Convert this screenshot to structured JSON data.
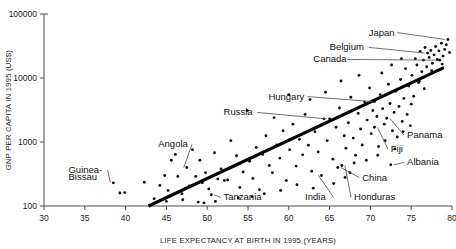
{
  "chart_data": {
    "type": "scatter",
    "title": "",
    "xlabel": "LIFE EXPECTANCY AT BIRTH IN 1995 (YEARS)",
    "ylabel": "GNP PER CAPITA IN 1995 (US$)",
    "xlim": [
      30,
      80
    ],
    "ylim": [
      100,
      100000
    ],
    "yscale": "log",
    "xscale": "linear",
    "grid": false,
    "legend": null,
    "xticks": [
      30,
      35,
      40,
      45,
      50,
      55,
      60,
      65,
      70,
      75,
      80
    ],
    "xtick_labels": [
      "30",
      "35",
      "40",
      "45",
      "50",
      "55",
      "60",
      "65",
      "70",
      "75",
      "80"
    ],
    "yticks": [
      100,
      1000,
      10000,
      100000
    ],
    "ytick_labels": [
      "100",
      "1000",
      "10000",
      "100000"
    ],
    "trendline": {
      "type": "linear-on-log",
      "x_start": 42.8,
      "y_start": 100,
      "x_end": 79.0,
      "y_end": 14500
    },
    "annotations": [
      {
        "label": "Japan",
        "text_x": 69.8,
        "text_y": 46000,
        "point_x": 79.5,
        "point_y": 40000,
        "anchor": "start"
      },
      {
        "label": "Belgium",
        "text_x": 65.0,
        "text_y": 27000,
        "point_x": 77.0,
        "point_y": 24500,
        "anchor": "start"
      },
      {
        "label": "Canada",
        "text_x": 63.0,
        "text_y": 17500,
        "point_x": 78.5,
        "point_y": 19000,
        "anchor": "start"
      },
      {
        "label": "Hungary",
        "text_x": 57.5,
        "text_y": 4600,
        "point_x": 70.5,
        "point_y": 4300,
        "anchor": "start"
      },
      {
        "label": "Russia",
        "text_x": 52.0,
        "text_y": 2600,
        "point_x": 65.0,
        "point_y": 2300,
        "anchor": "start"
      },
      {
        "label": "Angola",
        "text_x": 44.0,
        "text_y": 830,
        "point_x": 47.5,
        "point_y": 400,
        "anchor": "start"
      },
      {
        "label": "Guinea-",
        "text_x": 33.0,
        "text_y": 330,
        "point_x": 38.5,
        "point_y": 230,
        "anchor": "start"
      },
      {
        "label": "Bissau",
        "text_x": 33.0,
        "text_y": 255,
        "point_x": null,
        "point_y": null,
        "anchor": "start"
      },
      {
        "label": "Tanzania",
        "text_x": 52.0,
        "text_y": 122,
        "point_x": 50.5,
        "point_y": 150,
        "anchor": "start"
      },
      {
        "label": "India",
        "text_x": 62.0,
        "text_y": 122,
        "point_x": 64.0,
        "point_y": 300,
        "anchor": "start"
      },
      {
        "label": "Honduras",
        "text_x": 68.0,
        "text_y": 122,
        "point_x": 66.5,
        "point_y": 430,
        "anchor": "start"
      },
      {
        "label": "China",
        "text_x": 69.0,
        "text_y": 250,
        "point_x": 66.0,
        "point_y": 400,
        "anchor": "start"
      },
      {
        "label": "Albania",
        "text_x": 74.5,
        "text_y": 430,
        "point_x": 72.5,
        "point_y": 440,
        "anchor": "start"
      },
      {
        "label": "Fiji",
        "text_x": 72.5,
        "text_y": 700,
        "point_x": 70.5,
        "point_y": 1700,
        "anchor": "start"
      },
      {
        "label": "Panama",
        "text_x": 74.5,
        "text_y": 1150,
        "point_x": 72.0,
        "point_y": 2350,
        "anchor": "start"
      }
    ],
    "points": [
      {
        "x": 38.5,
        "y": 230
      },
      {
        "x": 39.3,
        "y": 160
      },
      {
        "x": 39.9,
        "y": 162
      },
      {
        "x": 42.3,
        "y": 235
      },
      {
        "x": 43.5,
        "y": 130
      },
      {
        "x": 44.2,
        "y": 210
      },
      {
        "x": 44.8,
        "y": 300
      },
      {
        "x": 45.2,
        "y": 175
      },
      {
        "x": 45.6,
        "y": 520
      },
      {
        "x": 46.1,
        "y": 640
      },
      {
        "x": 46.4,
        "y": 290
      },
      {
        "x": 46.9,
        "y": 155
      },
      {
        "x": 47.5,
        "y": 400
      },
      {
        "x": 47.8,
        "y": 205
      },
      {
        "x": 48.2,
        "y": 760
      },
      {
        "x": 48.6,
        "y": 290
      },
      {
        "x": 48.9,
        "y": 115
      },
      {
        "x": 49.1,
        "y": 520
      },
      {
        "x": 49.4,
        "y": 230
      },
      {
        "x": 49.8,
        "y": 330
      },
      {
        "x": 50.2,
        "y": 185
      },
      {
        "x": 50.5,
        "y": 150
      },
      {
        "x": 50.9,
        "y": 680
      },
      {
        "x": 51.3,
        "y": 265
      },
      {
        "x": 51.7,
        "y": 380
      },
      {
        "x": 52.1,
        "y": 250
      },
      {
        "x": 52.5,
        "y": 255
      },
      {
        "x": 52.9,
        "y": 1050
      },
      {
        "x": 53.2,
        "y": 420
      },
      {
        "x": 53.6,
        "y": 610
      },
      {
        "x": 54.0,
        "y": 195
      },
      {
        "x": 54.4,
        "y": 340
      },
      {
        "x": 54.9,
        "y": 3100
      },
      {
        "x": 55.2,
        "y": 500
      },
      {
        "x": 55.6,
        "y": 270
      },
      {
        "x": 56.0,
        "y": 820
      },
      {
        "x": 56.4,
        "y": 180
      },
      {
        "x": 56.8,
        "y": 640
      },
      {
        "x": 57.2,
        "y": 1250
      },
      {
        "x": 57.6,
        "y": 430
      },
      {
        "x": 58.0,
        "y": 330
      },
      {
        "x": 58.5,
        "y": 900
      },
      {
        "x": 58.9,
        "y": 560
      },
      {
        "x": 59.3,
        "y": 1500
      },
      {
        "x": 59.7,
        "y": 250
      },
      {
        "x": 60.1,
        "y": 760
      },
      {
        "x": 60.5,
        "y": 1900
      },
      {
        "x": 60.9,
        "y": 420
      },
      {
        "x": 61.3,
        "y": 1100
      },
      {
        "x": 61.7,
        "y": 630
      },
      {
        "x": 62.0,
        "y": 2700
      },
      {
        "x": 62.4,
        "y": 890
      },
      {
        "x": 62.8,
        "y": 350
      },
      {
        "x": 63.2,
        "y": 1450
      },
      {
        "x": 63.6,
        "y": 700
      },
      {
        "x": 64.0,
        "y": 300
      },
      {
        "x": 64.3,
        "y": 2300
      },
      {
        "x": 64.7,
        "y": 1050
      },
      {
        "x": 65.0,
        "y": 2300
      },
      {
        "x": 65.4,
        "y": 540
      },
      {
        "x": 65.8,
        "y": 1700
      },
      {
        "x": 66.0,
        "y": 400
      },
      {
        "x": 66.2,
        "y": 3400
      },
      {
        "x": 66.5,
        "y": 430
      },
      {
        "x": 66.8,
        "y": 1250
      },
      {
        "x": 67.0,
        "y": 800
      },
      {
        "x": 67.3,
        "y": 2000
      },
      {
        "x": 67.6,
        "y": 5000
      },
      {
        "x": 67.9,
        "y": 1150
      },
      {
        "x": 68.2,
        "y": 620
      },
      {
        "x": 68.5,
        "y": 2800
      },
      {
        "x": 68.8,
        "y": 1600
      },
      {
        "x": 69.0,
        "y": 900
      },
      {
        "x": 69.3,
        "y": 4200
      },
      {
        "x": 69.6,
        "y": 2200
      },
      {
        "x": 69.9,
        "y": 7000
      },
      {
        "x": 70.1,
        "y": 1350
      },
      {
        "x": 70.3,
        "y": 3100
      },
      {
        "x": 70.5,
        "y": 1700
      },
      {
        "x": 70.5,
        "y": 4300
      },
      {
        "x": 70.8,
        "y": 2500
      },
      {
        "x": 71.0,
        "y": 850
      },
      {
        "x": 71.2,
        "y": 5500
      },
      {
        "x": 71.5,
        "y": 3300
      },
      {
        "x": 71.7,
        "y": 1900
      },
      {
        "x": 72.0,
        "y": 2350
      },
      {
        "x": 72.2,
        "y": 8000
      },
      {
        "x": 72.4,
        "y": 4000
      },
      {
        "x": 72.5,
        "y": 440
      },
      {
        "x": 72.7,
        "y": 1500
      },
      {
        "x": 72.9,
        "y": 2900
      },
      {
        "x": 73.1,
        "y": 6200
      },
      {
        "x": 73.3,
        "y": 1200
      },
      {
        "x": 73.5,
        "y": 3600
      },
      {
        "x": 73.7,
        "y": 9500
      },
      {
        "x": 73.9,
        "y": 2100
      },
      {
        "x": 74.1,
        "y": 4800
      },
      {
        "x": 74.3,
        "y": 14000
      },
      {
        "x": 74.5,
        "y": 2700
      },
      {
        "x": 74.7,
        "y": 7500
      },
      {
        "x": 74.9,
        "y": 1800
      },
      {
        "x": 75.1,
        "y": 11000
      },
      {
        "x": 75.3,
        "y": 5200
      },
      {
        "x": 75.5,
        "y": 20000
      },
      {
        "x": 75.7,
        "y": 16000
      },
      {
        "x": 75.9,
        "y": 8500
      },
      {
        "x": 76.1,
        "y": 26000
      },
      {
        "x": 76.3,
        "y": 12500
      },
      {
        "x": 76.5,
        "y": 19000
      },
      {
        "x": 76.7,
        "y": 30000
      },
      {
        "x": 76.9,
        "y": 15000
      },
      {
        "x": 77.0,
        "y": 24500
      },
      {
        "x": 77.2,
        "y": 21000
      },
      {
        "x": 77.4,
        "y": 27000
      },
      {
        "x": 77.6,
        "y": 17000
      },
      {
        "x": 77.8,
        "y": 23000
      },
      {
        "x": 78.0,
        "y": 31000
      },
      {
        "x": 78.2,
        "y": 19500
      },
      {
        "x": 78.4,
        "y": 26500
      },
      {
        "x": 78.5,
        "y": 19000
      },
      {
        "x": 78.7,
        "y": 35000
      },
      {
        "x": 78.9,
        "y": 22000
      },
      {
        "x": 79.1,
        "y": 28000
      },
      {
        "x": 79.3,
        "y": 33000
      },
      {
        "x": 79.5,
        "y": 40000
      },
      {
        "x": 79.7,
        "y": 25000
      },
      {
        "x": 76.0,
        "y": 9000
      },
      {
        "x": 77.5,
        "y": 13000
      },
      {
        "x": 78.8,
        "y": 16500
      },
      {
        "x": 75.0,
        "y": 3900
      },
      {
        "x": 76.6,
        "y": 6800
      },
      {
        "x": 74.0,
        "y": 1450
      },
      {
        "x": 73.0,
        "y": 780
      },
      {
        "x": 71.8,
        "y": 1050
      },
      {
        "x": 70.9,
        "y": 620
      },
      {
        "x": 69.5,
        "y": 520
      },
      {
        "x": 68.0,
        "y": 470
      },
      {
        "x": 67.5,
        "y": 330
      },
      {
        "x": 66.9,
        "y": 280
      },
      {
        "x": 65.5,
        "y": 225
      },
      {
        "x": 63.0,
        "y": 190
      },
      {
        "x": 61.0,
        "y": 215
      },
      {
        "x": 59.0,
        "y": 175
      },
      {
        "x": 57.0,
        "y": 155
      },
      {
        "x": 55.5,
        "y": 140
      },
      {
        "x": 53.8,
        "y": 135
      },
      {
        "x": 51.0,
        "y": 118
      },
      {
        "x": 49.6,
        "y": 112
      },
      {
        "x": 47.0,
        "y": 125
      },
      {
        "x": 45.0,
        "y": 118
      },
      {
        "x": 60.0,
        "y": 5500
      },
      {
        "x": 62.6,
        "y": 4600
      },
      {
        "x": 58.2,
        "y": 2400
      },
      {
        "x": 64.5,
        "y": 6000
      },
      {
        "x": 66.4,
        "y": 9000
      },
      {
        "x": 68.6,
        "y": 11000
      },
      {
        "x": 71.4,
        "y": 12000
      },
      {
        "x": 72.6,
        "y": 16000
      },
      {
        "x": 73.8,
        "y": 20000
      }
    ]
  },
  "axes": {
    "x_axis_name": "x-axis",
    "y_axis_name": "y-axis"
  }
}
